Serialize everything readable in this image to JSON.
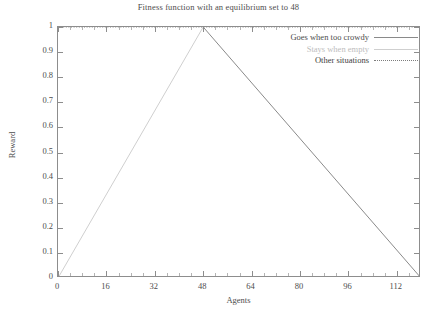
{
  "chart_data": {
    "type": "line",
    "title": "Fitness function with an equilibrium set to 48",
    "xlabel": "Agents",
    "ylabel": "Reward",
    "xlim": [
      0,
      120
    ],
    "ylim": [
      0,
      1
    ],
    "grid": false,
    "legend_position": "top-right",
    "xticks": [
      "0",
      "16",
      "32",
      "48",
      "64",
      "80",
      "96",
      "112"
    ],
    "xtick_values": [
      0,
      16,
      32,
      48,
      64,
      80,
      96,
      112
    ],
    "yticks": [
      "0",
      "0.1",
      "0.2",
      "0.3",
      "0.4",
      "0.5",
      "0.6",
      "0.7",
      "0.8",
      "0.9",
      "1"
    ],
    "ytick_values": [
      0,
      0.1,
      0.2,
      0.3,
      0.4,
      0.5,
      0.6,
      0.7,
      0.8,
      0.9,
      1
    ],
    "equilibrium": 48,
    "series": [
      {
        "name": "Goes when too crowdy",
        "style": "solid",
        "color": "#8a8a8a",
        "x": [
          48,
          120
        ],
        "y": [
          1,
          0
        ]
      },
      {
        "name": "Stays when empty",
        "style": "solid",
        "color": "#cfcfcf",
        "x": [
          0,
          48
        ],
        "y": [
          0,
          1
        ]
      },
      {
        "name": "Other situations",
        "style": "dotted",
        "color": "#7d7d7d",
        "x": [
          0,
          120
        ],
        "y": [
          1,
          1
        ]
      }
    ]
  },
  "legend": {
    "items": [
      {
        "label": "Goes when too crowdy"
      },
      {
        "label": "Stays when empty"
      },
      {
        "label": "Other situations"
      }
    ]
  }
}
